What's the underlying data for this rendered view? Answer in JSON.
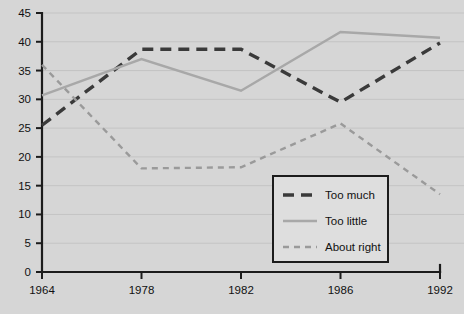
{
  "chart_data": {
    "type": "line",
    "title": "",
    "xlabel": "",
    "ylabel": "",
    "categories": [
      "1964",
      "1978",
      "1982",
      "1986",
      "1992"
    ],
    "x": [
      1964,
      1978,
      1982,
      1986,
      1992
    ],
    "ylim": [
      0,
      45
    ],
    "xlim": [
      1964,
      1992
    ],
    "yticks": [
      0,
      5,
      10,
      15,
      20,
      25,
      30,
      35,
      40,
      45
    ],
    "ytick_labels": [
      "0",
      "5",
      "10",
      "15",
      "20",
      "25",
      "30",
      "35",
      "40",
      "45"
    ],
    "xtick_labels": [
      "1964",
      "1978",
      "1982",
      "1986",
      "1992"
    ],
    "grid": true,
    "grid_axis": "y",
    "legend_position": "bottom-right-inside",
    "series": [
      {
        "name": "Too much",
        "values": [
          25.5,
          38.7,
          38.7,
          29.5,
          39.8
        ],
        "color": "#3a3a3a",
        "style": "dashed",
        "width": 3.4,
        "dasharray": "11,7"
      },
      {
        "name": "Too little",
        "values": [
          30.7,
          37.0,
          31.5,
          41.7,
          40.7
        ],
        "color": "#a8a8a8",
        "style": "solid",
        "width": 2.4,
        "dasharray": "none"
      },
      {
        "name": "About right",
        "values": [
          36.0,
          18.0,
          18.2,
          25.8,
          13.5
        ],
        "color": "#9a9a9a",
        "style": "dotted-dash",
        "width": 2.4,
        "dasharray": "6,5"
      }
    ]
  },
  "legend": {
    "items": [
      {
        "label": "Too much"
      },
      {
        "label": "Too little"
      },
      {
        "label": "About right"
      }
    ]
  },
  "colors": {
    "background": "#d6d6d6",
    "axis": "#1c1c1c",
    "grid": "#c4c4c4",
    "too_much": "#3a3a3a",
    "too_little": "#a8a8a8",
    "about_right": "#9a9a9a"
  }
}
